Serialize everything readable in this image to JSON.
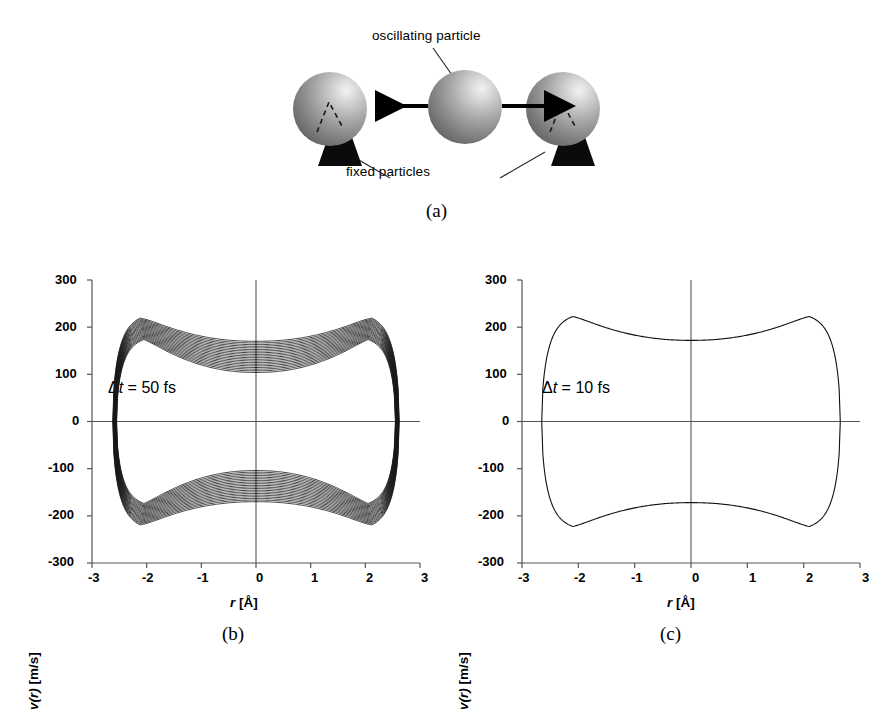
{
  "figure": {
    "panels": [
      {
        "tag": "(a)",
        "kind": "schematic"
      },
      {
        "tag": "(b)",
        "kind": "phase-plot"
      },
      {
        "tag": "(c)",
        "kind": "phase-plot"
      }
    ]
  },
  "schematic": {
    "label_oscillating": "oscillating particle",
    "label_fixed": "fixed particles",
    "particles": [
      {
        "role": "fixed-left",
        "has_base": true,
        "has_dashed_marker": true
      },
      {
        "role": "oscillating-center",
        "has_base": false,
        "has_dashed_marker": false
      },
      {
        "role": "fixed-right",
        "has_base": true,
        "has_dashed_marker": true
      }
    ],
    "arrows": [
      "arrow-left",
      "arrow-right"
    ],
    "sphere_color_light": "#f2f2f2",
    "sphere_color_dark": "#585858",
    "base_color": "#0b0b0b"
  },
  "axes": {
    "xlabel_var": "r",
    "xlabel_unit": " [Å]",
    "ylabel_var_open": "v",
    "ylabel_var_arg": "(r)",
    "ylabel_unit": " [m/s]",
    "xticks": [
      "-3",
      "-2",
      "-1",
      "0",
      "1",
      "2",
      "3"
    ],
    "yticks": [
      "300",
      "200",
      "100",
      "0",
      "-100",
      "-200",
      "-300"
    ]
  },
  "plot_b": {
    "annotation_prefix": "Δ",
    "annotation_var": "t",
    "annotation_value": " = 50 fs",
    "tag": "(b)"
  },
  "plot_c": {
    "annotation_prefix": "Δ",
    "annotation_var": "t",
    "annotation_value": " = 10 fs",
    "tag": "(c)"
  },
  "chart_data": [
    {
      "id": "b",
      "type": "line",
      "title": "",
      "subtitle": "Δt = 50 fs",
      "xlabel": "r [Å]",
      "ylabel": "v(r) [m/s]",
      "xlim": [
        -3,
        3
      ],
      "ylim": [
        -300,
        300
      ],
      "xticks": [
        -3,
        -2,
        -1,
        0,
        1,
        2,
        3
      ],
      "yticks": [
        -300,
        -200,
        -100,
        0,
        100,
        200,
        300
      ],
      "grid": false,
      "legend": null,
      "description": "Phase-space trajectory band: ~20 nested closed orbits showing energy drift for a 50 fs timestep. Each orbit is symmetric about both axes.",
      "n_orbits": 20,
      "orbits_outer": {
        "name": "outermost orbit",
        "turning_point_r": 2.62,
        "peak_speed": 225,
        "peak_speed_at_r": 2.12,
        "speed_at_r0": 170
      },
      "orbits_inner": {
        "name": "innermost orbit",
        "turning_point_r": 2.55,
        "peak_speed": 178,
        "peak_speed_at_r": 2.05,
        "speed_at_r0": 104
      },
      "series": [
        {
          "name": "upper branch outermost (v > 0)",
          "x": [
            -2.62,
            -2.55,
            -2.4,
            -2.25,
            -2.12,
            -1.9,
            -1.6,
            -1.2,
            -0.8,
            -0.4,
            0.0,
            0.4,
            0.8,
            1.2,
            1.6,
            1.9,
            2.12,
            2.25,
            2.4,
            2.55,
            2.62
          ],
          "y": [
            0,
            120,
            186,
            214,
            225,
            222,
            209,
            194,
            181,
            173,
            170,
            173,
            181,
            194,
            209,
            222,
            225,
            214,
            186,
            120,
            0
          ]
        },
        {
          "name": "lower branch outermost (v < 0)",
          "x": [
            -2.62,
            -2.55,
            -2.4,
            -2.25,
            -2.12,
            -1.9,
            -1.6,
            -1.2,
            -0.8,
            -0.4,
            0.0,
            0.4,
            0.8,
            1.2,
            1.6,
            1.9,
            2.12,
            2.25,
            2.4,
            2.55,
            2.62
          ],
          "y": [
            0,
            -120,
            -186,
            -214,
            -225,
            -222,
            -209,
            -194,
            -181,
            -173,
            -170,
            -173,
            -181,
            -194,
            -209,
            -222,
            -225,
            -214,
            -186,
            -120,
            0
          ]
        },
        {
          "name": "upper branch innermost (v > 0)",
          "x": [
            -2.55,
            -2.48,
            -2.34,
            -2.19,
            -2.05,
            -1.85,
            -1.55,
            -1.15,
            -0.75,
            -0.38,
            0.0,
            0.38,
            0.75,
            1.15,
            1.55,
            1.85,
            2.05,
            2.19,
            2.34,
            2.48,
            2.55
          ],
          "y": [
            0,
            100,
            152,
            170,
            178,
            175,
            160,
            140,
            120,
            108,
            104,
            108,
            120,
            140,
            160,
            175,
            178,
            170,
            152,
            100,
            0
          ]
        },
        {
          "name": "lower branch innermost (v < 0)",
          "x": [
            -2.55,
            -2.48,
            -2.34,
            -2.19,
            -2.05,
            -1.85,
            -1.55,
            -1.15,
            -0.75,
            -0.38,
            0.0,
            0.38,
            0.75,
            1.15,
            1.55,
            1.85,
            2.05,
            2.19,
            2.34,
            2.48,
            2.55
          ],
          "y": [
            0,
            -100,
            -152,
            -170,
            -178,
            -175,
            -160,
            -140,
            -120,
            -108,
            -104,
            -108,
            -120,
            -140,
            -160,
            -175,
            -178,
            -170,
            -152,
            -100,
            0
          ]
        }
      ]
    },
    {
      "id": "c",
      "type": "line",
      "title": "",
      "subtitle": "Δt = 10 fs",
      "xlabel": "r [Å]",
      "ylabel": "v(r) [m/s]",
      "xlim": [
        -3,
        3
      ],
      "ylim": [
        -300,
        300
      ],
      "xticks": [
        -3,
        -2,
        -1,
        0,
        1,
        2,
        3
      ],
      "yticks": [
        -300,
        -200,
        -100,
        0,
        100,
        200,
        300
      ],
      "grid": false,
      "legend": null,
      "description": "Phase-space trajectory: a single closed orbit (no visible energy drift) for a 10 fs timestep.",
      "n_orbits": 1,
      "orbits_outer": {
        "name": "closed orbit",
        "turning_point_r": 2.65,
        "peak_speed": 227,
        "peak_speed_at_r": 2.1,
        "speed_at_r0": 172
      },
      "series": [
        {
          "name": "upper branch (v > 0)",
          "x": [
            -2.65,
            -2.58,
            -2.42,
            -2.27,
            -2.1,
            -1.88,
            -1.58,
            -1.18,
            -0.78,
            -0.38,
            0.0,
            0.38,
            0.78,
            1.18,
            1.58,
            1.88,
            2.1,
            2.27,
            2.42,
            2.58,
            2.65
          ],
          "y": [
            0,
            122,
            188,
            216,
            227,
            224,
            211,
            196,
            183,
            175,
            172,
            175,
            183,
            196,
            211,
            224,
            227,
            216,
            188,
            122,
            0
          ]
        },
        {
          "name": "lower branch (v < 0)",
          "x": [
            -2.65,
            -2.58,
            -2.42,
            -2.27,
            -2.1,
            -1.88,
            -1.58,
            -1.18,
            -0.78,
            -0.38,
            0.0,
            0.38,
            0.78,
            1.18,
            1.58,
            1.88,
            2.1,
            2.27,
            2.42,
            2.58,
            2.65
          ],
          "y": [
            0,
            -122,
            -188,
            -216,
            -227,
            -224,
            -211,
            -196,
            -183,
            -175,
            -172,
            -175,
            -183,
            -196,
            -211,
            -224,
            -227,
            -216,
            -188,
            -122,
            0
          ]
        }
      ]
    }
  ]
}
